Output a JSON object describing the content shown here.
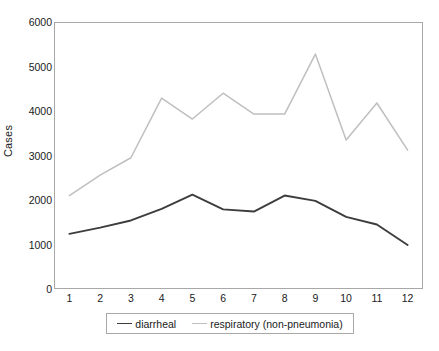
{
  "chart_data": {
    "type": "line",
    "title": "",
    "xlabel": "",
    "ylabel": "Cases",
    "categories": [
      "1",
      "2",
      "3",
      "4",
      "5",
      "6",
      "7",
      "8",
      "9",
      "10",
      "11",
      "12"
    ],
    "series": [
      {
        "name": "diarrheal",
        "color": "#3d3d3d",
        "values": [
          1240,
          1380,
          1540,
          1800,
          2120,
          1790,
          1740,
          2100,
          1980,
          1620,
          1450,
          990
        ]
      },
      {
        "name": "respiratory (non-pneumonia)",
        "color": "#bfbfbf",
        "values": [
          2100,
          2560,
          2950,
          4290,
          3820,
          4400,
          3930,
          3930,
          5280,
          3350,
          4180,
          3120
        ]
      }
    ],
    "ylim": [
      0,
      6000
    ],
    "yticks": [
      0,
      1000,
      2000,
      3000,
      4000,
      5000,
      6000
    ],
    "ytick_labels": [
      "0",
      "1000",
      "2000",
      "3000",
      "4000",
      "5000",
      "6000"
    ],
    "grid": false,
    "legend_position": "bottom"
  },
  "legend": {
    "entries": [
      {
        "label": "diarrheal",
        "color": "#3d3d3d"
      },
      {
        "label": "respiratory (non-pneumonia)",
        "color": "#bfbfbf"
      }
    ]
  },
  "caption": {
    "text": ""
  },
  "colors": {
    "axis": "#a8a8a8",
    "text": "#1a1a1a",
    "diarrheal": "#3d3d3d",
    "respiratory": "#bfbfbf"
  }
}
